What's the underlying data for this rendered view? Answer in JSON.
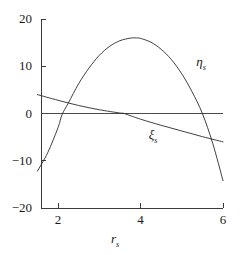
{
  "chart_data": {
    "type": "line",
    "title": "",
    "xlabel": "rₛ",
    "ylabel": "",
    "xlim": [
      1.5,
      6
    ],
    "ylim": [
      -20,
      20
    ],
    "xticks": [
      2,
      4,
      6
    ],
    "yticks": [
      20,
      10,
      0,
      -10,
      -20
    ],
    "xtick_labels": [
      "2",
      "4",
      "6"
    ],
    "ytick_labels": [
      "20",
      "10",
      "0",
      "−10",
      "−20"
    ],
    "grid": false,
    "legend_position": "inline-labels",
    "zero_line": 0,
    "series": [
      {
        "name": "ηₛ",
        "label": "η",
        "label_sub": "s",
        "label_x": 5.35,
        "label_y": 10.8,
        "x": [
          1.5,
          1.75,
          2.0,
          2.1,
          2.25,
          2.5,
          2.75,
          3.0,
          3.25,
          3.5,
          3.75,
          3.9,
          4.0,
          4.25,
          4.5,
          4.75,
          5.0,
          5.25,
          5.5,
          5.75,
          6.0
        ],
        "values": [
          -12.2,
          -8.3,
          -3.0,
          -0.2,
          2.2,
          6.3,
          9.6,
          12.3,
          14.2,
          15.4,
          15.95,
          16.0,
          15.9,
          15.1,
          13.6,
          11.4,
          8.4,
          4.6,
          0.0,
          -6.3,
          -14.2
        ]
      },
      {
        "name": "ξₛ",
        "label": "ξ",
        "label_sub": "s",
        "label_x": 4.2,
        "label_y": -4.6,
        "x": [
          1.5,
          2.0,
          2.5,
          3.0,
          3.5,
          3.6,
          4.0,
          4.5,
          5.0,
          5.5,
          6.0
        ],
        "values": [
          4.0,
          2.8,
          1.7,
          0.8,
          0.1,
          0.0,
          -1.2,
          -2.5,
          -3.7,
          -4.9,
          -6.0
        ]
      }
    ]
  },
  "axis_title": {
    "symbol": "r",
    "subscript": "s"
  },
  "y_axis": {
    "labels": [
      "20",
      "10",
      "0",
      "−10",
      "−20"
    ],
    "values": [
      20,
      10,
      0,
      -10,
      -20
    ]
  },
  "x_axis": {
    "labels": [
      "2",
      "4",
      "6"
    ],
    "values": [
      2,
      4,
      6
    ]
  },
  "colors": {
    "curve": "#2b2b2b",
    "axis": "#3a3a3a",
    "background": "#ffffff",
    "text": "#1a1a1a"
  }
}
